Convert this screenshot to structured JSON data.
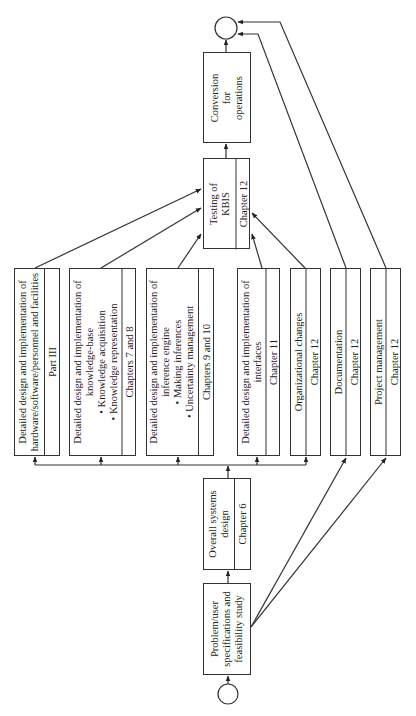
{
  "diagram": {
    "start": "start-node",
    "end": "end-node",
    "boxes": {
      "problem": {
        "title": "Problem/user specifications and feasibility study"
      },
      "overall": {
        "title": "Overall systems design",
        "ref": "Chapter 6"
      },
      "hardware": {
        "title": "Detailed design and implementation of hardware/software/personnel and facilities",
        "ref": "Part III"
      },
      "kb": {
        "title": "Detailed design and implementation of knowledge-base",
        "bullets": [
          "• Knowledge acquisition",
          "• Knowledge representation"
        ],
        "ref": "Chapters 7 and 8"
      },
      "inference": {
        "title": "Detailed design and implementation of inference engine",
        "bullets": [
          "• Making inferences",
          "• Uncertainty management"
        ],
        "ref": "Chapters 9 and 10"
      },
      "interfaces": {
        "title": "Detailed design and implementation of interfaces",
        "ref": "Chapter 11"
      },
      "org": {
        "title": "Organizational changes",
        "ref": "Chapter 12"
      },
      "docs": {
        "title": "Documentation",
        "ref": "Chapter 12"
      },
      "pm": {
        "title": "Project management",
        "ref": "Chapter 12"
      },
      "testing": {
        "title": "Testing of KBIS",
        "ref": "Chapter 12"
      },
      "conversion": {
        "title": "Conversion for operations"
      }
    }
  }
}
